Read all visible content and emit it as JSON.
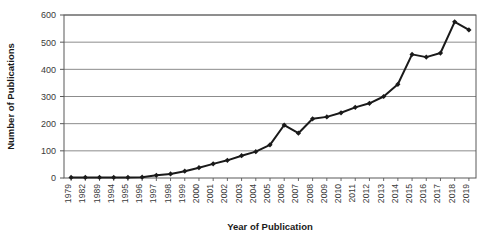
{
  "chart_data": {
    "type": "line",
    "title": "",
    "xlabel": "Year of Publication",
    "ylabel": "Number of Publications",
    "categories": [
      "1979",
      "1982",
      "1989",
      "1994",
      "1995",
      "1996",
      "1997",
      "1998",
      "1999",
      "2000",
      "2001",
      "2002",
      "2003",
      "2004",
      "2005",
      "2006",
      "2007",
      "2008",
      "2009",
      "2010",
      "2011",
      "2012",
      "2013",
      "2014",
      "2015",
      "2016",
      "2017",
      "2018",
      "2019"
    ],
    "values": [
      2,
      2,
      2,
      2,
      2,
      3,
      10,
      15,
      25,
      38,
      52,
      65,
      82,
      97,
      122,
      195,
      165,
      218,
      225,
      240,
      260,
      275,
      300,
      345,
      455,
      445,
      460,
      575,
      545
    ],
    "yticks": [
      0,
      100,
      200,
      300,
      400,
      500,
      600
    ],
    "ylim": [
      0,
      600
    ],
    "grid": true,
    "legend": false,
    "marker": "diamond",
    "line_color": "#1a1a1a",
    "marker_color": "#1a1a1a",
    "grid_color": "#7f7f7f",
    "frame_color": "#595959",
    "background": "#ffffff"
  }
}
